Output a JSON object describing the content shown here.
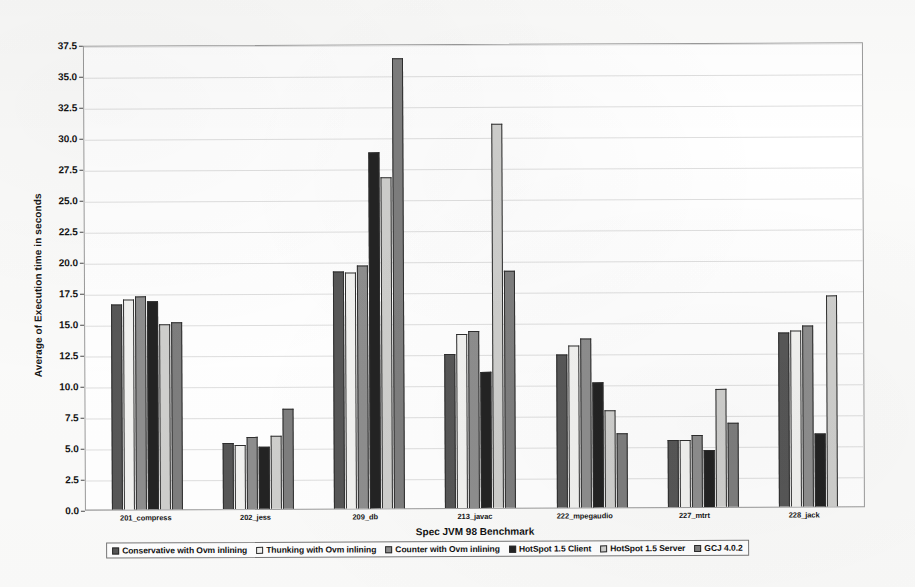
{
  "chart_data": {
    "type": "bar",
    "title": "",
    "xlabel": "Spec JVM 98 Benchmark",
    "ylabel": "Average of Execution time in seconds",
    "categories": [
      "201_compress",
      "202_jess",
      "209_db",
      "213_javac",
      "222_mpegaudio",
      "227_mtrt",
      "228_jack"
    ],
    "ylim": [
      0.0,
      37.5
    ],
    "ytick_labels": [
      "0.0",
      "2.5",
      "5.0",
      "7.5",
      "10.0",
      "12.5",
      "15.0",
      "17.5",
      "20.0",
      "22.5",
      "25.0",
      "27.5",
      "30.0",
      "32.5",
      "35.0",
      "37.5"
    ],
    "ytick_values": [
      0.0,
      2.5,
      5.0,
      7.5,
      10.0,
      12.5,
      15.0,
      17.5,
      20.0,
      22.5,
      25.0,
      27.5,
      30.0,
      32.5,
      35.0,
      37.5
    ],
    "grid": true,
    "legend_position": "bottom",
    "series": [
      {
        "name": "Conservative with Ovm inlining",
        "color": "#575757",
        "values": [
          16.5,
          5.3,
          19.1,
          12.4,
          12.3,
          5.4,
          14.0
        ]
      },
      {
        "name": "Thunking with Ovm inlining",
        "color": "#f2f2f0",
        "values": [
          16.9,
          5.2,
          19.0,
          14.0,
          13.1,
          5.4,
          14.2
        ]
      },
      {
        "name": "Counter with Ovm inlining",
        "color": "#8e8e8e",
        "values": [
          17.2,
          5.8,
          19.6,
          14.3,
          13.6,
          5.8,
          14.6
        ]
      },
      {
        "name": "HotSpot 1.5 Client",
        "color": "#232323",
        "values": [
          16.8,
          5.0,
          28.7,
          11.0,
          10.1,
          4.6,
          5.9
        ]
      },
      {
        "name": "HotSpot 1.5 Server",
        "color": "#cfcfcd",
        "values": [
          14.9,
          5.9,
          26.7,
          31.0,
          7.8,
          9.5,
          17.0
        ]
      },
      {
        "name": "GCJ 4.0.2",
        "color": "#7e7e7e",
        "values": [
          15.1,
          8.1,
          36.3,
          19.1,
          6.0,
          6.8,
          0
        ]
      }
    ]
  }
}
